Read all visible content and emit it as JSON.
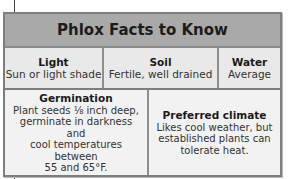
{
  "title": "Phlox Facts to Know",
  "row1": [
    {
      "heading": "Light",
      "value": "Sun or light shade"
    },
    {
      "heading": "Soil",
      "value": "Fertile, well drained"
    },
    {
      "heading": "Water",
      "value": "Average"
    }
  ],
  "row2": [
    {
      "heading": "Germination",
      "lines": [
        "Plant seeds ⅛ inch deep,",
        "germinate in darkness and",
        "cool temperatures between",
        "55 and 65°F."
      ]
    },
    {
      "heading": "Preferred climate",
      "lines": [
        "Likes cool weather, but",
        "established plants can",
        "tolerate heat."
      ]
    }
  ]
}
